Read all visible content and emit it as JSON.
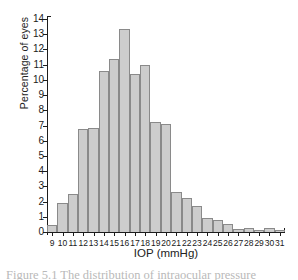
{
  "chart_data": {
    "type": "bar",
    "title": "",
    "xlabel": "IOP (mmHg)",
    "ylabel": "Percentage of eyes",
    "categories": [
      9,
      10,
      11,
      12,
      13,
      14,
      15,
      16,
      17,
      18,
      19,
      20,
      21,
      22,
      23,
      24,
      25,
      26,
      27,
      28,
      29,
      30,
      31
    ],
    "values": [
      0.45,
      1.9,
      2.5,
      6.75,
      6.85,
      10.6,
      11.4,
      13.35,
      10.4,
      10.95,
      7.2,
      7.1,
      2.6,
      2.25,
      1.7,
      0.95,
      0.8,
      0.5,
      0.2,
      0.25,
      0.15,
      0.25,
      0.1
    ],
    "xlim": [
      8.5,
      31.5
    ],
    "ylim": [
      0,
      14
    ],
    "ytick_labels": [
      "0",
      "1",
      "2",
      "3",
      "4",
      "5",
      "6",
      "7",
      "8",
      "9",
      "10",
      "11",
      "12",
      "13",
      "14"
    ],
    "xtick_labels": [
      "9",
      "10",
      "11",
      "12",
      "13",
      "14",
      "15",
      "16",
      "17",
      "18",
      "19",
      "20",
      "21",
      "22",
      "23",
      "24",
      "25",
      "26",
      "27",
      "28",
      "29",
      "30",
      "31"
    ],
    "grid": false,
    "legend": null,
    "bar_fill_color": "#cdcdcd",
    "bar_edge_color": "#8a8a8a",
    "axis_color": "#1d1d1d"
  },
  "caption": {
    "text": "Figure 5.1   The distribution of intraocular pressure"
  }
}
